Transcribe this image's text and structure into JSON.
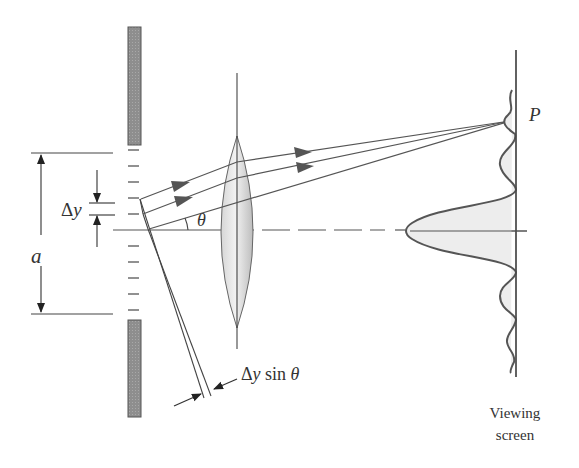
{
  "figure": {
    "labels": {
      "delta_y_prefix": "Δ",
      "delta_y_var": "y",
      "slit_width": "a",
      "angle": "θ",
      "point": "P",
      "path_diff_prefix": "Δ",
      "path_diff_var": "y",
      "path_diff_mid": " sin ",
      "path_diff_angle": "θ",
      "screen_line1": "Viewing",
      "screen_line2": "screen"
    },
    "colors": {
      "line": "#4a4a4a",
      "barrier_fill": "#8c8c8c",
      "lens_fill": "#c8c8c8",
      "profile_fill": "#ececec",
      "arrow": "#555555"
    },
    "slit_segments": 11,
    "rays": 3
  }
}
